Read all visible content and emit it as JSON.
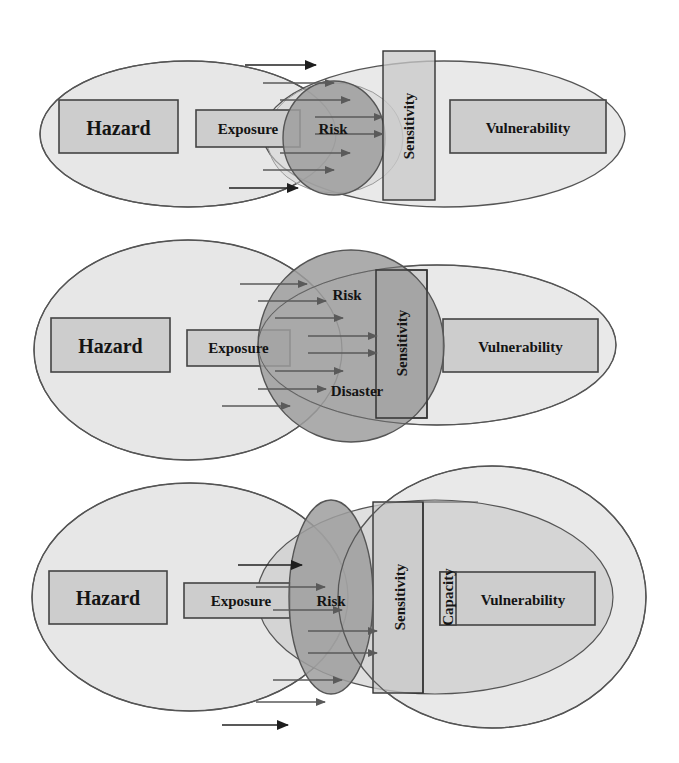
{
  "diagram": {
    "type": "conceptual-venn",
    "panels": [
      {
        "id": "panel-1",
        "labels": {
          "hazard": "Hazard",
          "exposure": "Exposure",
          "risk": "Risk",
          "sensitivity": "Sensitivity",
          "vulnerability": "Vulnerability"
        }
      },
      {
        "id": "panel-2",
        "labels": {
          "hazard": "Hazard",
          "exposure": "Exposure",
          "risk": "Risk",
          "disaster": "Disaster",
          "sensitivity": "Sensitivity",
          "vulnerability": "Vulnerability"
        }
      },
      {
        "id": "panel-3",
        "labels": {
          "hazard": "Hazard",
          "exposure": "Exposure",
          "risk": "Risk",
          "sensitivity": "Sensitivity",
          "capacity": "Capacity",
          "vulnerability": "Vulnerability"
        }
      }
    ],
    "colors": {
      "background": "#ffffff",
      "ellipse_fill": "#e7e7e7",
      "box_fill": "#cdcdcd",
      "risk_fill": "#9e9e9e",
      "stroke": "#444444",
      "text": "#141414"
    }
  }
}
